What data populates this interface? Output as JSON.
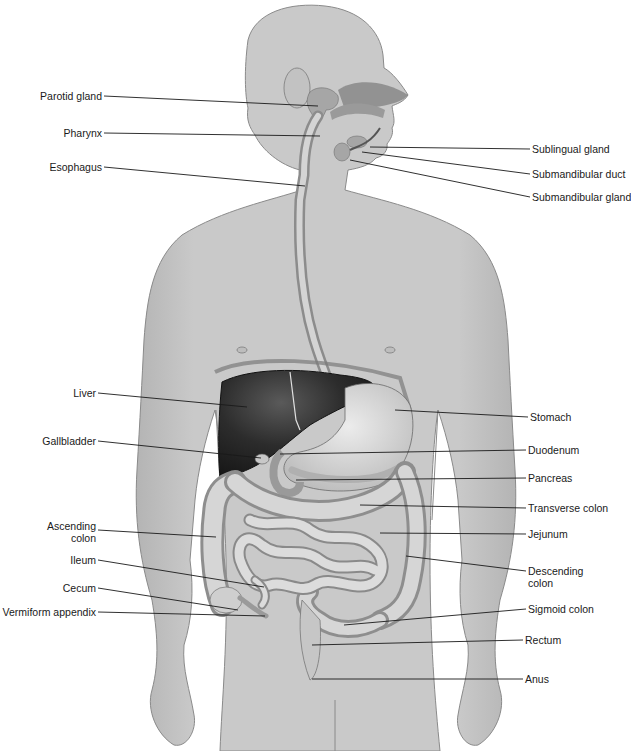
{
  "diagram": {
    "colors": {
      "background": "#ffffff",
      "body_fill": "#c8c8c8",
      "body_outline": "#8a8a8a",
      "liver": "#2a2a2a",
      "organ_fill": "#d8d8d8",
      "leader_line": "#1a1a1a",
      "label_text": "#1a1a1a"
    },
    "labels_left": [
      {
        "id": "parotid-gland",
        "text": "Parotid gland",
        "x": 104,
        "y": 96,
        "tx": 318,
        "ty": 106
      },
      {
        "id": "pharynx",
        "text": "Pharynx",
        "x": 104,
        "y": 133,
        "tx": 320,
        "ty": 136
      },
      {
        "id": "esophagus",
        "text": "Esophagus",
        "x": 104,
        "y": 167,
        "tx": 305,
        "ty": 186
      },
      {
        "id": "liver",
        "text": "Liver",
        "x": 98,
        "y": 393,
        "tx": 247,
        "ty": 407
      },
      {
        "id": "gallbladder",
        "text": "Gallbladder",
        "x": 98,
        "y": 441,
        "tx": 261,
        "ty": 458
      },
      {
        "id": "ascending-colon",
        "text": "Ascending\ncolon",
        "x": 98,
        "y": 530,
        "tx": 216,
        "ty": 537
      },
      {
        "id": "ileum",
        "text": "Ileum",
        "x": 98,
        "y": 560,
        "tx": 264,
        "ty": 587
      },
      {
        "id": "cecum",
        "text": "Cecum",
        "x": 98,
        "y": 588,
        "tx": 238,
        "ty": 610
      },
      {
        "id": "vermiform-appendix",
        "text": "Vermiform appendix",
        "x": 98,
        "y": 612,
        "tx": 265,
        "ty": 616
      }
    ],
    "labels_right": [
      {
        "id": "sublingual-gland",
        "text": "Sublingual gland",
        "x": 530,
        "y": 149,
        "tx": 370,
        "ty": 147
      },
      {
        "id": "submandibular-duct",
        "text": "Submandibular duct",
        "x": 530,
        "y": 174,
        "tx": 362,
        "ty": 152
      },
      {
        "id": "submandibular-gland",
        "text": "Submandibular gland",
        "x": 530,
        "y": 197,
        "tx": 350,
        "ty": 160
      },
      {
        "id": "stomach",
        "text": "Stomach",
        "x": 528,
        "y": 417,
        "tx": 395,
        "ty": 410
      },
      {
        "id": "duodenum",
        "text": "Duodenum",
        "x": 526,
        "y": 450,
        "tx": 280,
        "ty": 454
      },
      {
        "id": "pancreas",
        "text": "Pancreas",
        "x": 526,
        "y": 478,
        "tx": 296,
        "ty": 480
      },
      {
        "id": "transverse-colon",
        "text": "Transverse colon",
        "x": 526,
        "y": 508,
        "tx": 360,
        "ty": 505
      },
      {
        "id": "jejunum",
        "text": "Jejunum",
        "x": 526,
        "y": 534,
        "tx": 380,
        "ty": 533
      },
      {
        "id": "descending-colon",
        "text": "Descending\ncolon",
        "x": 526,
        "y": 571,
        "tx": 406,
        "ty": 556
      },
      {
        "id": "sigmoid-colon",
        "text": "Sigmoid colon",
        "x": 526,
        "y": 609,
        "tx": 344,
        "ty": 625
      },
      {
        "id": "rectum",
        "text": "Rectum",
        "x": 523,
        "y": 640,
        "tx": 312,
        "ty": 645
      },
      {
        "id": "anus",
        "text": "Anus",
        "x": 523,
        "y": 679,
        "tx": 312,
        "ty": 679
      }
    ]
  }
}
